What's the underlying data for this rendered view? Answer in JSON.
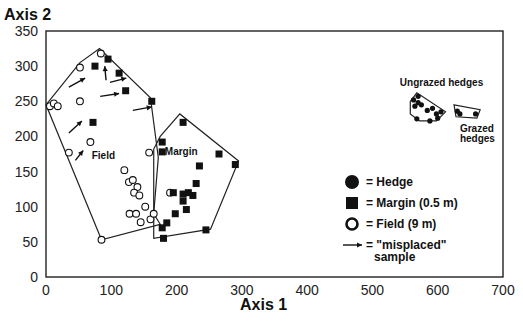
{
  "chart_data": {
    "type": "scatter",
    "title": "",
    "xlabel": "Axis 1",
    "ylabel": "Axis 2",
    "xlim": [
      0,
      700
    ],
    "ylim": [
      0,
      350
    ],
    "x_ticks": [
      0,
      100,
      200,
      300,
      400,
      500,
      600,
      700
    ],
    "y_ticks": [
      0,
      50,
      100,
      150,
      200,
      250,
      300,
      350
    ],
    "grid": false,
    "legend_position": "lower right (inside plot)",
    "legend": [
      {
        "symbol": "filled-circle",
        "label": "= Hedge"
      },
      {
        "symbol": "filled-square",
        "label": "= Margin (0.5 m)"
      },
      {
        "symbol": "open-circle",
        "label": "= Field (9 m)"
      },
      {
        "symbol": "arrow",
        "label": "= \"misplaced\"",
        "label2": "sample"
      }
    ],
    "series": [
      {
        "name": "Field (9 m)",
        "marker": "open-circle",
        "points": [
          [
            6,
            243
          ],
          [
            12,
            247
          ],
          [
            18,
            243
          ],
          [
            52,
            298
          ],
          [
            52,
            250
          ],
          [
            84,
            318
          ],
          [
            35,
            177
          ],
          [
            68,
            192
          ],
          [
            120,
            152
          ],
          [
            127,
            135
          ],
          [
            133,
            138
          ],
          [
            140,
            128
          ],
          [
            135,
            120
          ],
          [
            143,
            116
          ],
          [
            152,
            100
          ],
          [
            128,
            90
          ],
          [
            138,
            90
          ],
          [
            145,
            78
          ],
          [
            160,
            82
          ],
          [
            165,
            90
          ],
          [
            190,
            120
          ],
          [
            158,
            177
          ],
          [
            85,
            53
          ]
        ]
      },
      {
        "name": "Margin (0.5 m)",
        "marker": "filled-square",
        "points": [
          [
            75,
            300
          ],
          [
            95,
            310
          ],
          [
            112,
            290
          ],
          [
            122,
            265
          ],
          [
            162,
            250
          ],
          [
            72,
            220
          ],
          [
            210,
            220
          ],
          [
            178,
            192
          ],
          [
            178,
            178
          ],
          [
            265,
            175
          ],
          [
            290,
            160
          ],
          [
            235,
            158
          ],
          [
            195,
            120
          ],
          [
            210,
            118
          ],
          [
            218,
            120
          ],
          [
            225,
            116
          ],
          [
            210,
            108
          ],
          [
            230,
            133
          ],
          [
            198,
            90
          ],
          [
            215,
            96
          ],
          [
            185,
            77
          ],
          [
            178,
            70
          ],
          [
            180,
            55
          ],
          [
            245,
            67
          ]
        ]
      },
      {
        "name": "Hedge (ungrazed)",
        "marker": "filled-circle",
        "points": [
          [
            563,
            252
          ],
          [
            570,
            257
          ],
          [
            565,
            243
          ],
          [
            575,
            245
          ],
          [
            584,
            237
          ],
          [
            592,
            240
          ],
          [
            598,
            232
          ],
          [
            568,
            225
          ],
          [
            588,
            222
          ],
          [
            600,
            226
          ],
          [
            605,
            235
          ],
          [
            570,
            248
          ]
        ]
      },
      {
        "name": "Hedge (grazed)",
        "marker": "filled-circle",
        "points": [
          [
            630,
            236
          ],
          [
            634,
            232
          ],
          [
            658,
            232
          ]
        ]
      }
    ],
    "hulls": [
      {
        "name": "Field",
        "points": [
          [
            0,
            245
          ],
          [
            52,
            305
          ],
          [
            82,
            325
          ],
          [
            160,
            255
          ],
          [
            172,
            170
          ],
          [
            165,
            90
          ],
          [
            175,
            75
          ],
          [
            85,
            53
          ]
        ]
      },
      {
        "name": "Margin",
        "points": [
          [
            165,
            55
          ],
          [
            165,
            182
          ],
          [
            175,
            200
          ],
          [
            205,
            232
          ],
          [
            295,
            165
          ],
          [
            252,
            68
          ]
        ]
      },
      {
        "name": "Ungrazed hedges",
        "points": [
          [
            558,
            250
          ],
          [
            568,
            262
          ],
          [
            612,
            235
          ],
          [
            598,
            222
          ],
          [
            572,
            222
          ],
          [
            558,
            232
          ]
        ]
      },
      {
        "name": "Grazed hedges",
        "points": [
          [
            625,
            245
          ],
          [
            665,
            238
          ],
          [
            660,
            226
          ],
          [
            628,
            228
          ]
        ]
      }
    ],
    "misplaced_arrows": [
      [
        [
          35,
          205
        ],
        [
          55,
          222
        ]
      ],
      [
        [
          35,
          270
        ],
        [
          60,
          283
        ]
      ],
      [
        [
          92,
          280
        ],
        [
          90,
          300
        ]
      ],
      [
        [
          98,
          277
        ],
        [
          123,
          283
        ]
      ],
      [
        [
          83,
          257
        ],
        [
          112,
          261
        ]
      ],
      [
        [
          133,
          237
        ],
        [
          162,
          242
        ]
      ],
      [
        [
          45,
          166
        ],
        [
          57,
          180
        ]
      ]
    ],
    "annotations": [
      {
        "text": "Field",
        "x": 70,
        "y": 168
      },
      {
        "text": "Margin",
        "x": 182,
        "y": 174
      },
      {
        "text": "Ungrazed hedges",
        "x": 542,
        "y": 272
      },
      {
        "text": "Grazed",
        "x": 634,
        "y": 207
      },
      {
        "text": "hedges",
        "x": 634,
        "y": 192
      }
    ]
  },
  "labels": {
    "y_axis_title": "Axis 2",
    "x_axis_title": "Axis 1"
  }
}
